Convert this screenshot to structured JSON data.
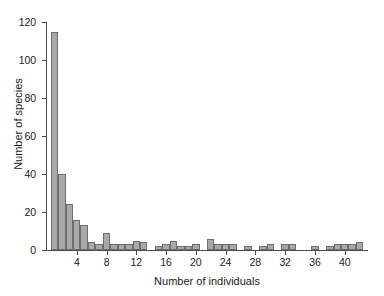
{
  "chart_data": {
    "type": "bar",
    "title": "",
    "xlabel": "Number of individuals",
    "ylabel": "Number of species",
    "xlim": [
      0,
      43
    ],
    "ylim": [
      0,
      120
    ],
    "grid": false,
    "legend": null,
    "xticks": [
      4,
      8,
      12,
      16,
      20,
      24,
      28,
      32,
      36,
      40
    ],
    "yticks": [
      0,
      20,
      40,
      60,
      80,
      100,
      120
    ],
    "bar_color": "#a9a9a9",
    "bar_edge_color": "#6e6e6e",
    "axis_color": "#4a4a4a",
    "background_color": "#ffffff",
    "bin_width": 1,
    "categories": [
      1,
      2,
      3,
      4,
      5,
      6,
      7,
      8,
      9,
      10,
      11,
      12,
      13,
      14,
      15,
      16,
      17,
      18,
      19,
      20,
      21,
      22,
      23,
      24,
      25,
      26,
      27,
      28,
      29,
      30,
      31,
      32,
      33,
      34,
      35,
      36,
      37,
      38,
      39,
      40,
      41,
      42
    ],
    "values": [
      115,
      40,
      24,
      16,
      13,
      4,
      3,
      9,
      3,
      3,
      3,
      5,
      4,
      0,
      2,
      3,
      5,
      2,
      2,
      3,
      0,
      6,
      3,
      3,
      3,
      0,
      2,
      0,
      2,
      3,
      0,
      3,
      3,
      0,
      0,
      2,
      0,
      2,
      3,
      3,
      3,
      4
    ]
  },
  "axis": {
    "y_labels": [
      "0",
      "20",
      "40",
      "60",
      "80",
      "100",
      "120"
    ],
    "x_labels": [
      "4",
      "8",
      "12",
      "16",
      "20",
      "24",
      "28",
      "32",
      "36",
      "40"
    ],
    "x_title": "Number of individuals",
    "y_title": "Number of species"
  }
}
